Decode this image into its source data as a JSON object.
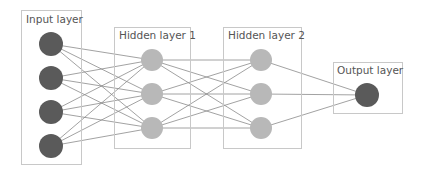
{
  "colors": {
    "dark_node": "#5a5a5a",
    "light_node": "#b8b8b8",
    "box_border": "#c8c8c8",
    "edge": "#8a8a8a",
    "label": "#555555"
  },
  "layers": [
    {
      "id": "input",
      "label": "Input layer",
      "box": {
        "x": 21.5,
        "y": 10.5,
        "w": 60,
        "h": 154
      },
      "label_pos": {
        "x": 26,
        "y": 23
      },
      "node_color": "dark",
      "nodes": [
        {
          "x": 51,
          "y": 44
        },
        {
          "x": 51,
          "y": 78
        },
        {
          "x": 51,
          "y": 112
        },
        {
          "x": 51,
          "y": 146
        }
      ],
      "r": 12
    },
    {
      "id": "hidden1",
      "label": "Hidden layer 1",
      "box": {
        "x": 114.5,
        "y": 27.5,
        "w": 76,
        "h": 121
      },
      "label_pos": {
        "x": 119,
        "y": 39
      },
      "node_color": "light",
      "nodes": [
        {
          "x": 152,
          "y": 60
        },
        {
          "x": 152,
          "y": 94
        },
        {
          "x": 152,
          "y": 128
        }
      ],
      "r": 11
    },
    {
      "id": "hidden2",
      "label": "Hidden layer 2",
      "box": {
        "x": 223.5,
        "y": 27.5,
        "w": 78,
        "h": 121
      },
      "label_pos": {
        "x": 228,
        "y": 39
      },
      "node_color": "light",
      "nodes": [
        {
          "x": 261,
          "y": 60
        },
        {
          "x": 261,
          "y": 94
        },
        {
          "x": 261,
          "y": 128
        }
      ],
      "r": 11
    },
    {
      "id": "output",
      "label": "Output layer",
      "box": {
        "x": 333.5,
        "y": 62.5,
        "w": 69,
        "h": 51
      },
      "label_pos": {
        "x": 337,
        "y": 74
      },
      "node_color": "dark",
      "nodes": [
        {
          "x": 367,
          "y": 95
        }
      ],
      "r": 12
    }
  ]
}
